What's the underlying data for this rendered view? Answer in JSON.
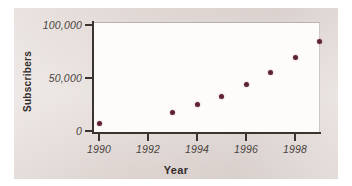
{
  "chart_data": {
    "type": "scatter",
    "title": "",
    "xlabel": "Year",
    "ylabel": "Subscribers",
    "x": [
      1990,
      1993,
      1994,
      1995,
      1996,
      1997,
      1998,
      1999
    ],
    "values": [
      7500,
      17000,
      25000,
      33000,
      44000,
      55000,
      69000,
      84000
    ],
    "series": [
      {
        "name": "Subscribers",
        "points": [
          {
            "x": 1990,
            "y": 7500
          },
          {
            "x": 1993,
            "y": 17000
          },
          {
            "x": 1994,
            "y": 25000
          },
          {
            "x": 1995,
            "y": 33000
          },
          {
            "x": 1996,
            "y": 44000
          },
          {
            "x": 1997,
            "y": 55000
          },
          {
            "x": 1998,
            "y": 69000
          },
          {
            "x": 1999,
            "y": 84000
          }
        ]
      }
    ],
    "xlim": [
      1989.4,
      1999.7
    ],
    "ylim": [
      0,
      105000
    ],
    "xticks": [
      1990,
      1992,
      1994,
      1996,
      1998
    ],
    "xtick_labels": [
      "1990",
      "1992",
      "1994",
      "1996",
      "1998"
    ],
    "yticks": [
      0,
      50000,
      100000
    ],
    "ytick_labels": [
      "0",
      "50,000",
      "100,000"
    ],
    "grid": false,
    "legend": false,
    "marker_color": "#5e2233",
    "axis_color": "#3a3330",
    "plot_background": "#fdfcfb",
    "figure_background": "#e7e0dd"
  }
}
